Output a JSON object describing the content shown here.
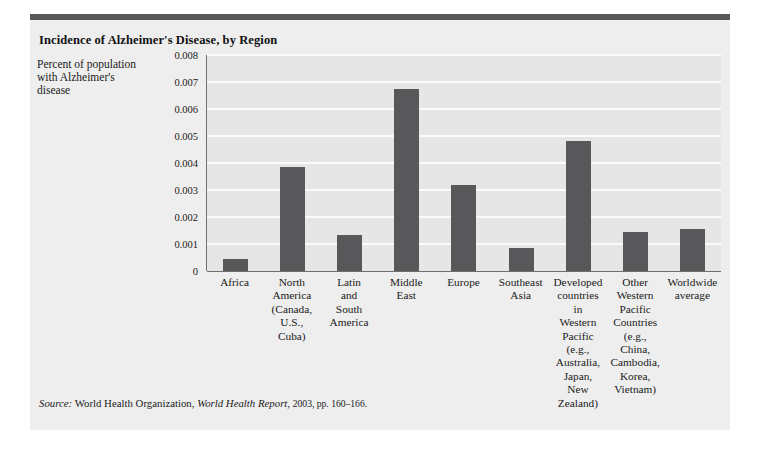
{
  "chart_title": "Incidence of Alzheimer's Disease, by Region",
  "source": {
    "prefix": "Source:",
    "publisher": "World Health Organization,",
    "report": "World Health Report,",
    "details": "2003, pp. 160–166."
  },
  "chart_data": {
    "type": "bar",
    "title": "Incidence of Alzheimer's Disease, by Region",
    "xlabel": "",
    "ylabel": "Percent of population with Alzheimer's disease",
    "ylim": [
      0,
      0.008
    ],
    "yticks": [
      "0.008",
      "0.007",
      "0.006",
      "0.005",
      "0.004",
      "0.003",
      "0.002",
      "0.001",
      "0"
    ],
    "ytick_values": [
      0.008,
      0.007,
      0.006,
      0.005,
      0.004,
      0.003,
      0.002,
      0.001,
      0
    ],
    "grid": true,
    "legend": "none",
    "categories": [
      "Africa",
      "North America (Canada, U.S., Cuba)",
      "Latin and South America",
      "Middle East",
      "Europe",
      "Southeast Asia",
      "Developed countries in Western Pacific (e.g., Australia, Japan, New Zealand)",
      "Other Western Pacific Countries (e.g., China, Cambodia, Korea, Vietnam)",
      "Worldwide average"
    ],
    "category_lines": [
      [
        "Africa"
      ],
      [
        "North",
        "America",
        "(Canada,",
        "U.S.,",
        "Cuba)"
      ],
      [
        "Latin",
        "and",
        "South",
        "America"
      ],
      [
        "Middle",
        "East"
      ],
      [
        "Europe"
      ],
      [
        "Southeast",
        "Asia"
      ],
      [
        "Developed",
        "countries",
        "in",
        "Western",
        "Pacific",
        "(e.g.,",
        "Australia,",
        "Japan,",
        "New",
        "Zealand)"
      ],
      [
        "Other",
        "Western",
        "Pacific",
        "Countries",
        "(e.g.,",
        "China,",
        "Cambodia,",
        "Korea,",
        "Vietnam)"
      ],
      [
        "Worldwide",
        "average"
      ]
    ],
    "values": [
      0.00045,
      0.00385,
      0.00135,
      0.00675,
      0.0032,
      0.00085,
      0.0048,
      0.00145,
      0.00155
    ],
    "bar_color": "#58585a",
    "plot_background": "#e6e6e6",
    "gridline_color": "#fbfbfb",
    "axis_color": "#6f6f70"
  }
}
